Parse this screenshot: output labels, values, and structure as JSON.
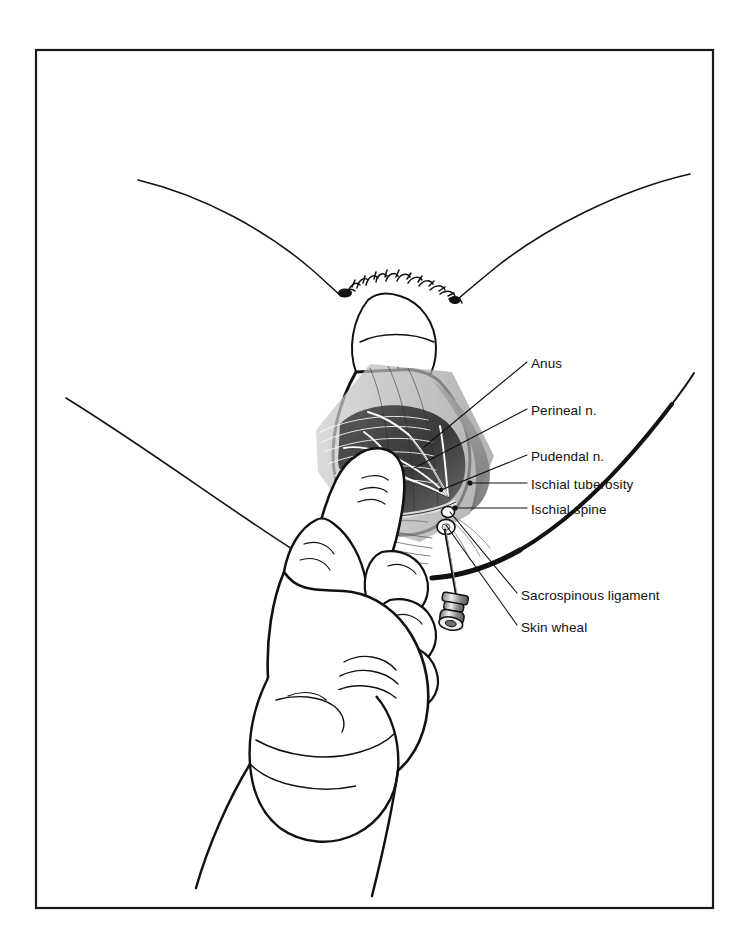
{
  "figure": {
    "background_color": "#ffffff",
    "ink_color": "#111111",
    "frame": {
      "name": "illustration-border",
      "x": 36,
      "y": 50,
      "width": 677,
      "height": 858,
      "stroke_color": "#1a1a1a",
      "stroke_width": 2.2
    }
  },
  "labels": [
    {
      "id": "anus",
      "text": "Anus",
      "x": 531,
      "y": 366,
      "leader": {
        "from_x": 527,
        "from_y": 362,
        "to_x": 424,
        "to_y": 447
      }
    },
    {
      "id": "perineal-nerve",
      "text": "Perineal n.",
      "x": 531,
      "y": 413,
      "leader": {
        "from_x": 527,
        "from_y": 409,
        "to_x": 414,
        "to_y": 468
      }
    },
    {
      "id": "pudendal-nerve",
      "text": "Pudendal n.",
      "x": 531,
      "y": 459,
      "leader": {
        "from_x": 527,
        "from_y": 455,
        "to_x": 441,
        "to_y": 490
      }
    },
    {
      "id": "ischial-tuberosity",
      "text": "Ischial tuberosity",
      "x": 531,
      "y": 487,
      "leader": {
        "from_x": 527,
        "from_y": 483,
        "to_x": 470,
        "to_y": 483
      }
    },
    {
      "id": "ischial-spine",
      "text": "Ischial spine",
      "x": 531,
      "y": 512,
      "leader": {
        "from_x": 527,
        "from_y": 508,
        "to_x": 455,
        "to_y": 508
      }
    },
    {
      "id": "sacrospinous-ligament",
      "text": "Sacrospinous ligament",
      "x": 521,
      "y": 598,
      "leader": {
        "from_x": 517,
        "from_y": 593,
        "to_x": 450,
        "to_y": 512
      }
    },
    {
      "id": "skin-wheal",
      "text": "Skin wheal",
      "x": 521,
      "y": 630,
      "leader": {
        "from_x": 517,
        "from_y": 625,
        "to_x": 446,
        "to_y": 525
      }
    }
  ],
  "anatomy": {
    "structures": [
      "left-thigh-outline",
      "right-thigh-outline",
      "left-upper-body-outline",
      "right-upper-body-outline",
      "vulva-outline",
      "pubic-hair-stipple",
      "perineum",
      "ischiorectal-fossa-shading",
      "pudendal-nerve-branches",
      "sacrospinous-ligament-band"
    ]
  },
  "instrument": {
    "name": "needle-with-guide",
    "parts": [
      "needle-shaft",
      "needle-hub",
      "trumpet-guide"
    ]
  },
  "hand": {
    "name": "gloved-examining-hand",
    "parts": [
      "index-finger",
      "thumb",
      "folded-fingers",
      "glove-cuff",
      "wrist-band"
    ]
  }
}
